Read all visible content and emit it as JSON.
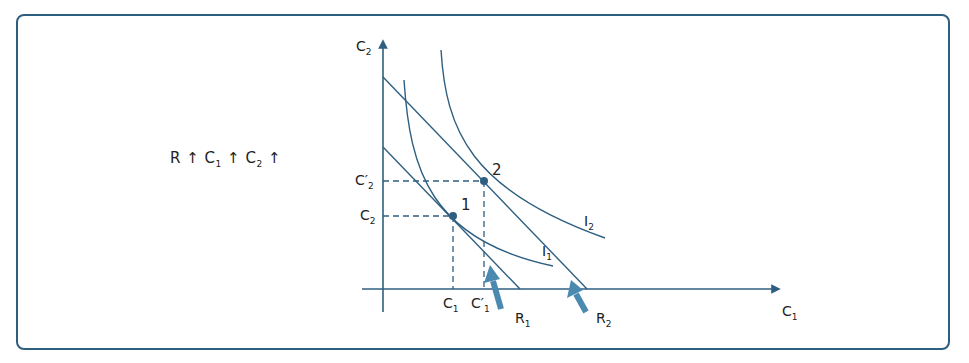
{
  "caption": {
    "parts": [
      {
        "base": "R",
        "sub": ""
      },
      {
        "base": "C",
        "sub": "1"
      },
      {
        "base": "C",
        "sub": "2"
      }
    ],
    "arrow": "↑",
    "text": "R ↑ C1 ↑ C2 ↑"
  },
  "diagram": {
    "axes": {
      "y_label": {
        "base": "C",
        "sub": "2"
      },
      "x_label": {
        "base": "C",
        "sub": "1"
      }
    },
    "ticks": {
      "y": [
        {
          "base": "C′",
          "sub": "2"
        },
        {
          "base": "C",
          "sub": "2"
        }
      ],
      "x": [
        {
          "base": "C",
          "sub": "1"
        },
        {
          "base": "C′",
          "sub": "1"
        }
      ]
    },
    "points": [
      {
        "label": "1"
      },
      {
        "label": "2"
      }
    ],
    "curves": [
      {
        "label": {
          "base": "I",
          "sub": "1"
        }
      },
      {
        "label": {
          "base": "I",
          "sub": "2"
        }
      }
    ],
    "budget_lines": [
      {
        "label": {
          "base": "R",
          "sub": "1"
        }
      },
      {
        "label": {
          "base": "R",
          "sub": "2"
        }
      }
    ],
    "colors": {
      "frame": "#2f5f80",
      "lines": "#2f5f80",
      "shift_arrow": "#4a8ab0"
    }
  }
}
